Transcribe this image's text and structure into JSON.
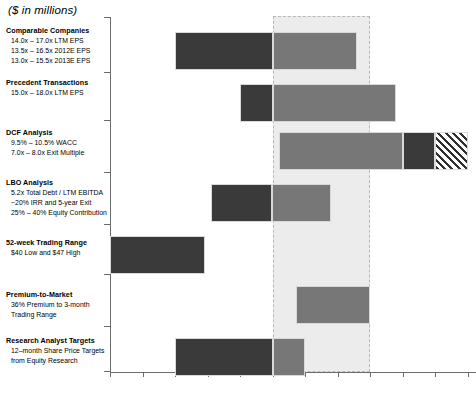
{
  "title": "($ in millions)",
  "chart_data": {
    "type": "bar",
    "title": "($ in millions)",
    "orientation": "horizontal",
    "xlabel": "",
    "ylabel": "",
    "xlim": [
      40.0,
      67.5
    ],
    "xticks": [
      "$40.00",
      "$42.50",
      "$45.00",
      "$47.50",
      "$50.00",
      "$52.50",
      "$55.00",
      "$57.50",
      "$60.00",
      "$62.50",
      "$65.00",
      "$67.50"
    ],
    "xtick_values": [
      40.0,
      42.5,
      45.0,
      47.5,
      50.0,
      52.5,
      55.0,
      57.5,
      60.0,
      62.5,
      65.0,
      67.5
    ],
    "grid": false,
    "legend": "none",
    "highlight_band": {
      "from": 52.5,
      "to": 60.0,
      "label": "",
      "style": "dashed-gray-fill"
    },
    "categories": [
      {
        "head": "Comparable Companies",
        "subs": [
          "14.0x – 17.0x LTM EPS",
          "13.5x – 16.5x 2012E EPS",
          "13.0x – 15.5x 2013E EPS"
        ],
        "low": 45.0,
        "high": 59.0,
        "segments": [
          {
            "from": 45.0,
            "to": 52.5,
            "style": "dark"
          },
          {
            "from": 52.5,
            "to": 59.0,
            "style": "mid"
          }
        ]
      },
      {
        "head": "Precedent Transactions",
        "subs": [
          "15.0x – 18.0x LTM EPS"
        ],
        "low": 50.0,
        "high": 62.0,
        "segments": [
          {
            "from": 50.0,
            "to": 52.5,
            "style": "dark"
          },
          {
            "from": 52.5,
            "to": 62.0,
            "style": "mid"
          }
        ]
      },
      {
        "head": "DCF Analysis",
        "subs": [
          "9.5% – 10.5% WACC",
          "7.0x – 8.0x Exit Multiple"
        ],
        "low": 53.0,
        "high": 67.5,
        "segments": [
          {
            "from": 53.0,
            "to": 62.5,
            "style": "mid"
          },
          {
            "from": 62.5,
            "to": 65.0,
            "style": "dark"
          },
          {
            "from": 65.0,
            "to": 67.5,
            "style": "hatch"
          }
        ]
      },
      {
        "head": "LBO Analysis",
        "subs": [
          "5.2x Total Debt / LTM EBITDA",
          "~20% IRR and 5-year Exit",
          "25% – 40% Equity Contribution"
        ],
        "low": 47.8,
        "high": 57.0,
        "segments": [
          {
            "from": 47.8,
            "to": 52.5,
            "style": "dark"
          },
          {
            "from": 52.5,
            "to": 57.0,
            "style": "mid"
          }
        ]
      },
      {
        "head": "52-week Trading Range",
        "subs": [
          "$40 Low and $47 High"
        ],
        "low": 40.0,
        "high": 47.3,
        "segments": [
          {
            "from": 40.0,
            "to": 47.3,
            "style": "dark"
          }
        ]
      },
      {
        "head": "Premium-to-Market",
        "subs": [
          "36% Premium to 3-month",
          "Trading Range"
        ],
        "low": 54.3,
        "high": 60.0,
        "segments": [
          {
            "from": 54.3,
            "to": 60.0,
            "style": "mid"
          }
        ]
      },
      {
        "head": "Research Analyst Targets",
        "subs": [
          "12–month Share Price Targets",
          "from Equity Research"
        ],
        "low": 45.0,
        "high": 55.0,
        "segments": [
          {
            "from": 45.0,
            "to": 52.5,
            "style": "dark"
          },
          {
            "from": 52.5,
            "to": 55.0,
            "style": "mid"
          }
        ]
      }
    ]
  },
  "colors": {
    "dark": "#3a3a3a",
    "mid": "#777777",
    "band_fill": "#ececec",
    "band_border": "#b8b8b8",
    "axis": "#6b6b6b"
  }
}
